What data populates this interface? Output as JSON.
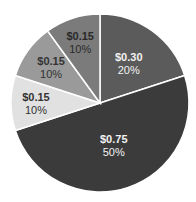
{
  "chart_data": {
    "type": "pie",
    "title": "",
    "start_angle_deg": 0,
    "direction": "clockwise",
    "slices": [
      {
        "label_value": "$0.30",
        "label_pct": "20%",
        "value": 0.3,
        "percent": 20,
        "color": "#5b5b5b",
        "text_color": "#f2f2f2"
      },
      {
        "label_value": "$0.75",
        "label_pct": "50%",
        "value": 0.75,
        "percent": 50,
        "color": "#3b3b3b",
        "text_color": "#f2f2f2"
      },
      {
        "label_value": "$0.15",
        "label_pct": "10%",
        "value": 0.15,
        "percent": 10,
        "color": "#e1e1e1",
        "text_color": "#333333"
      },
      {
        "label_value": "$0.15",
        "label_pct": "10%",
        "value": 0.15,
        "percent": 10,
        "color": "#9a9a9a",
        "text_color": "#333333"
      },
      {
        "label_value": "$0.15",
        "label_pct": "10%",
        "value": 0.15,
        "percent": 10,
        "color": "#7b7b7b",
        "text_color": "#2a2a2a"
      }
    ],
    "separator_color": "#ffffff",
    "legend": "none"
  }
}
